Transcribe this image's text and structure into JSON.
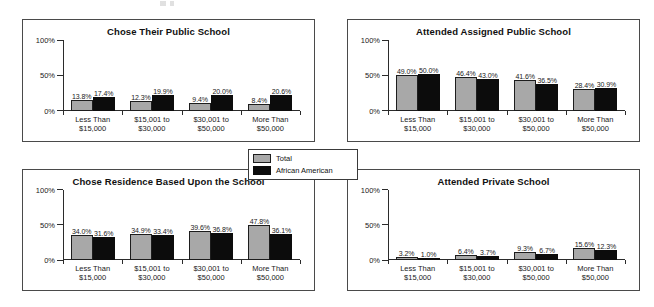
{
  "legend": {
    "items": [
      {
        "label": "Total",
        "color": "#a8a8a8",
        "key": "total"
      },
      {
        "label": "African American",
        "color": "#0c0c0c",
        "key": "african_american"
      }
    ]
  },
  "axis": {
    "yticks": [
      "0%",
      "50%",
      "100%"
    ],
    "ymin": 0,
    "ymax": 100
  },
  "categories": [
    {
      "line1": "Less Than",
      "line2": "$15,000"
    },
    {
      "line1": "$15,001 to",
      "line2": "$30,000"
    },
    {
      "line1": "$30,001 to",
      "line2": "$50,000"
    },
    {
      "line1": "More Than",
      "line2": "$50,000"
    }
  ],
  "chart_data": [
    {
      "type": "bar",
      "title": "Chose Their Public School",
      "xlabel": "",
      "ylabel": "",
      "ylim": [
        0,
        100
      ],
      "yticks": [
        0,
        50,
        100
      ],
      "ytick_labels": [
        "0%",
        "50%",
        "100%"
      ],
      "grid": false,
      "legend_position": "center-shared",
      "categories": [
        "Less Than $15,000",
        "$15,001 to $30,000",
        "$30,001 to $50,000",
        "More Than $50,000"
      ],
      "series": [
        {
          "name": "Total",
          "color": "#a8a8a8",
          "values": [
            13.8,
            12.3,
            9.4,
            8.4
          ],
          "labels": [
            "13.8%",
            "12.3%",
            "9.4%",
            "8.4%"
          ]
        },
        {
          "name": "African American",
          "color": "#0c0c0c",
          "values": [
            17.4,
            19.9,
            20.0,
            20.6
          ],
          "labels": [
            "17.4%",
            "19.9%",
            "20.0%",
            "20.6%"
          ]
        }
      ]
    },
    {
      "type": "bar",
      "title": "Attended Assigned Public School",
      "xlabel": "",
      "ylabel": "",
      "ylim": [
        0,
        100
      ],
      "yticks": [
        0,
        50,
        100
      ],
      "ytick_labels": [
        "0%",
        "50%",
        "100%"
      ],
      "grid": false,
      "legend_position": "center-shared",
      "categories": [
        "Less Than $15,000",
        "$15,001 to $30,000",
        "$30,001 to $50,000",
        "More Than $50,000"
      ],
      "series": [
        {
          "name": "Total",
          "color": "#a8a8a8",
          "values": [
            49.0,
            46.4,
            41.6,
            28.4
          ],
          "labels": [
            "49.0%",
            "46.4%",
            "41.6%",
            "28.4%"
          ]
        },
        {
          "name": "African American",
          "color": "#0c0c0c",
          "values": [
            50.0,
            43.0,
            36.5,
            30.9
          ],
          "labels": [
            "50.0%",
            "43.0%",
            "36.5%",
            "30.9%"
          ]
        }
      ]
    },
    {
      "type": "bar",
      "title": "Chose Residence Based Upon the School",
      "xlabel": "",
      "ylabel": "",
      "ylim": [
        0,
        100
      ],
      "yticks": [
        0,
        50,
        100
      ],
      "ytick_labels": [
        "0%",
        "50%",
        "100%"
      ],
      "grid": false,
      "legend_position": "center-shared",
      "categories": [
        "Less Than $15,000",
        "$15,001 to $30,000",
        "$30,001 to $50,000",
        "More Than $50,000"
      ],
      "series": [
        {
          "name": "Total",
          "color": "#a8a8a8",
          "values": [
            34.0,
            34.9,
            39.6,
            47.8
          ],
          "labels": [
            "34.0%",
            "34.9%",
            "39.6%",
            "47.8%"
          ]
        },
        {
          "name": "African American",
          "color": "#0c0c0c",
          "values": [
            31.6,
            33.4,
            36.8,
            36.1
          ],
          "labels": [
            "31.6%",
            "33.4%",
            "36.8%",
            "36.1%"
          ]
        }
      ]
    },
    {
      "type": "bar",
      "title": "Attended Private School",
      "xlabel": "",
      "ylabel": "",
      "ylim": [
        0,
        100
      ],
      "yticks": [
        0,
        50,
        100
      ],
      "ytick_labels": [
        "0%",
        "50%",
        "100%"
      ],
      "grid": false,
      "legend_position": "center-shared",
      "categories": [
        "Less Than $15,000",
        "$15,001 to $30,000",
        "$30,001 to $50,000",
        "More Than $50,000"
      ],
      "series": [
        {
          "name": "Total",
          "color": "#a8a8a8",
          "values": [
            3.2,
            6.4,
            9.3,
            15.6
          ],
          "labels": [
            "3.2%",
            "6.4%",
            "9.3%",
            "15.6%"
          ]
        },
        {
          "name": "African American",
          "color": "#0c0c0c",
          "values": [
            1.0,
            3.7,
            6.7,
            12.3
          ],
          "labels": [
            "1.0%",
            "3.7%",
            "6.7%",
            "12.3%"
          ]
        }
      ]
    }
  ]
}
